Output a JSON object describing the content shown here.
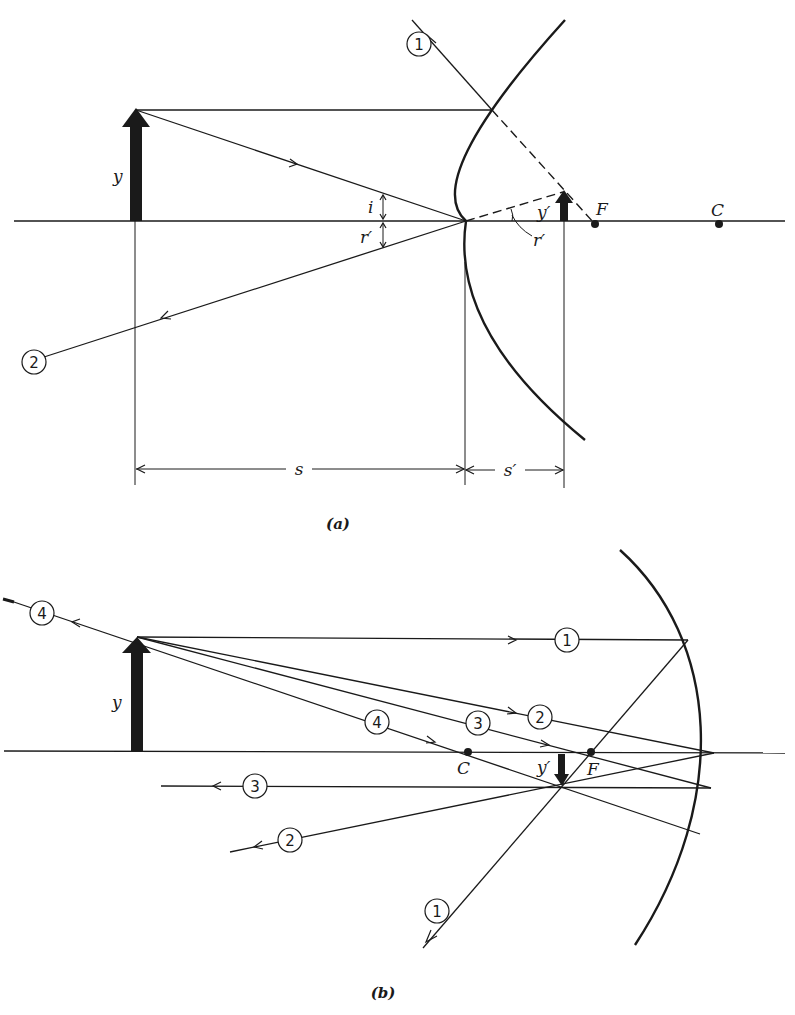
{
  "figure_a": {
    "caption": "(a)",
    "object_label": "y",
    "image_label": "y′",
    "focal_label": "F",
    "center_label": "C",
    "angle_incidence_label": "i",
    "angle_reflection_label": "r′",
    "angle_reflection_image_label": "r′",
    "object_distance_label": "s",
    "image_distance_label": "s′",
    "rays": [
      {
        "id": "1",
        "label": "1"
      },
      {
        "id": "2",
        "label": "2"
      }
    ],
    "mirror_type": "convex"
  },
  "figure_b": {
    "caption": "(b)",
    "object_label": "y",
    "image_label": "y′",
    "focal_label": "F",
    "center_label": "C",
    "rays": [
      {
        "id": "1",
        "label": "1"
      },
      {
        "id": "2",
        "label": "2"
      },
      {
        "id": "3",
        "label": "3"
      },
      {
        "id": "4",
        "label": "4"
      }
    ],
    "mirror_type": "concave"
  }
}
